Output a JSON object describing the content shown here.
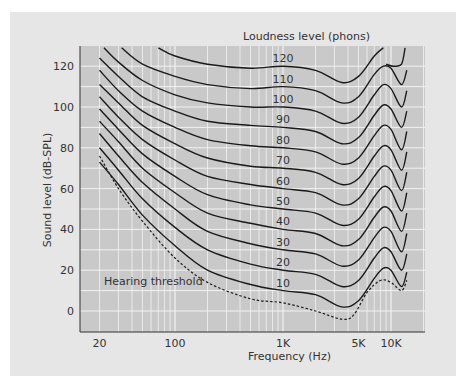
{
  "chart_data": {
    "type": "line",
    "title": "Loudness level (phons)",
    "xlabel": "Frequency (Hz)",
    "ylabel": "Sound level (dB-SPL)",
    "x_scale": "log",
    "xlim": [
      16,
      17000
    ],
    "ylim": [
      -9,
      130
    ],
    "grid": true,
    "x_ticks": [
      {
        "value": 20,
        "label": "20"
      },
      {
        "value": 100,
        "label": "100"
      },
      {
        "value": 1000,
        "label": "1K"
      },
      {
        "value": 5000,
        "label": "5K"
      },
      {
        "value": 10000,
        "label": "10K"
      }
    ],
    "y_ticks": [
      0,
      20,
      40,
      60,
      80,
      100,
      120
    ],
    "annotation": "Hearing threshold",
    "series": [
      {
        "name": "Hearing threshold",
        "style": "dashed",
        "points": [
          [
            20,
            76
          ],
          [
            30,
            60
          ],
          [
            50,
            44
          ],
          [
            100,
            26
          ],
          [
            200,
            14
          ],
          [
            500,
            6
          ],
          [
            1000,
            4
          ],
          [
            2000,
            0
          ],
          [
            3500,
            -4
          ],
          [
            4500,
            -2
          ],
          [
            6000,
            9
          ],
          [
            8000,
            15
          ],
          [
            10000,
            14
          ],
          [
            12500,
            10
          ],
          [
            14000,
            15
          ]
        ]
      },
      {
        "name": "10",
        "points": [
          [
            20,
            73
          ],
          [
            30,
            62
          ],
          [
            50,
            47
          ],
          [
            100,
            32
          ],
          [
            200,
            20
          ],
          [
            500,
            13
          ],
          [
            1000,
            10
          ],
          [
            2000,
            8
          ],
          [
            3500,
            2
          ],
          [
            5000,
            5
          ],
          [
            7000,
            16
          ],
          [
            8500,
            21
          ],
          [
            10000,
            20
          ],
          [
            12500,
            12
          ],
          [
            14000,
            19
          ]
        ]
      },
      {
        "name": "20",
        "points": [
          [
            20,
            80
          ],
          [
            30,
            69
          ],
          [
            50,
            55
          ],
          [
            100,
            41
          ],
          [
            200,
            30
          ],
          [
            500,
            23
          ],
          [
            1000,
            20
          ],
          [
            2000,
            18
          ],
          [
            3500,
            12
          ],
          [
            5000,
            15
          ],
          [
            7000,
            26
          ],
          [
            8500,
            31
          ],
          [
            10000,
            29
          ],
          [
            12500,
            20
          ],
          [
            14000,
            28
          ]
        ]
      },
      {
        "name": "30",
        "points": [
          [
            20,
            87
          ],
          [
            30,
            76
          ],
          [
            50,
            63
          ],
          [
            100,
            50
          ],
          [
            200,
            39
          ],
          [
            500,
            33
          ],
          [
            1000,
            30
          ],
          [
            2000,
            28
          ],
          [
            3500,
            22
          ],
          [
            5000,
            25
          ],
          [
            7000,
            36
          ],
          [
            8500,
            41
          ],
          [
            10000,
            39
          ],
          [
            12500,
            29
          ],
          [
            14000,
            38
          ]
        ]
      },
      {
        "name": "40",
        "points": [
          [
            20,
            93
          ],
          [
            30,
            83
          ],
          [
            50,
            70
          ],
          [
            100,
            58
          ],
          [
            200,
            48
          ],
          [
            500,
            43
          ],
          [
            1000,
            40
          ],
          [
            2000,
            38
          ],
          [
            3500,
            32
          ],
          [
            5000,
            35
          ],
          [
            7000,
            46
          ],
          [
            8500,
            51
          ],
          [
            10000,
            49
          ],
          [
            12500,
            39
          ],
          [
            14000,
            48
          ]
        ]
      },
      {
        "name": "50",
        "points": [
          [
            20,
            99
          ],
          [
            30,
            89
          ],
          [
            50,
            77
          ],
          [
            100,
            66
          ],
          [
            200,
            57
          ],
          [
            500,
            52
          ],
          [
            1000,
            50
          ],
          [
            2000,
            48
          ],
          [
            3500,
            42
          ],
          [
            5000,
            45
          ],
          [
            7000,
            56
          ],
          [
            8500,
            61
          ],
          [
            10000,
            59
          ],
          [
            12500,
            49
          ],
          [
            14000,
            58
          ]
        ]
      },
      {
        "name": "60",
        "points": [
          [
            20,
            105
          ],
          [
            30,
            95
          ],
          [
            50,
            84
          ],
          [
            100,
            74
          ],
          [
            200,
            66
          ],
          [
            500,
            62
          ],
          [
            1000,
            60
          ],
          [
            2000,
            58
          ],
          [
            3500,
            52
          ],
          [
            5000,
            55
          ],
          [
            7000,
            66
          ],
          [
            8500,
            71
          ],
          [
            10000,
            69
          ],
          [
            12500,
            59
          ],
          [
            14000,
            68
          ]
        ]
      },
      {
        "name": "70",
        "points": [
          [
            20,
            111
          ],
          [
            30,
            102
          ],
          [
            50,
            91
          ],
          [
            100,
            82
          ],
          [
            200,
            75
          ],
          [
            500,
            71
          ],
          [
            1000,
            70
          ],
          [
            2000,
            68
          ],
          [
            3500,
            62
          ],
          [
            5000,
            65
          ],
          [
            7000,
            76
          ],
          [
            8500,
            81
          ],
          [
            10000,
            79
          ],
          [
            12500,
            69
          ],
          [
            14000,
            78
          ]
        ]
      },
      {
        "name": "80",
        "points": [
          [
            20,
            118
          ],
          [
            30,
            108
          ],
          [
            50,
            98
          ],
          [
            100,
            90
          ],
          [
            200,
            84
          ],
          [
            500,
            81
          ],
          [
            1000,
            80
          ],
          [
            2000,
            78
          ],
          [
            3500,
            72
          ],
          [
            5000,
            75
          ],
          [
            7000,
            86
          ],
          [
            8500,
            91
          ],
          [
            10000,
            89
          ],
          [
            12500,
            79
          ],
          [
            14000,
            88
          ]
        ]
      },
      {
        "name": "90",
        "points": [
          [
            20,
            124
          ],
          [
            30,
            115
          ],
          [
            50,
            105
          ],
          [
            100,
            98
          ],
          [
            200,
            93
          ],
          [
            500,
            91
          ],
          [
            1000,
            90
          ],
          [
            2000,
            88
          ],
          [
            3500,
            82
          ],
          [
            5000,
            85
          ],
          [
            7000,
            96
          ],
          [
            8500,
            101
          ],
          [
            10000,
            99
          ],
          [
            12500,
            90
          ],
          [
            14000,
            98
          ]
        ]
      },
      {
        "name": "100",
        "points": [
          [
            22,
            129
          ],
          [
            30,
            122
          ],
          [
            50,
            113
          ],
          [
            100,
            106
          ],
          [
            200,
            102
          ],
          [
            500,
            100
          ],
          [
            1000,
            100
          ],
          [
            2000,
            98
          ],
          [
            3500,
            92
          ],
          [
            5000,
            95
          ],
          [
            7000,
            106
          ],
          [
            8500,
            111
          ],
          [
            10000,
            109
          ],
          [
            12500,
            100
          ],
          [
            14000,
            108
          ]
        ]
      },
      {
        "name": "110",
        "points": [
          [
            32,
            129
          ],
          [
            50,
            121
          ],
          [
            100,
            115
          ],
          [
            200,
            111
          ],
          [
            500,
            109
          ],
          [
            1000,
            110
          ],
          [
            2000,
            108
          ],
          [
            3500,
            102
          ],
          [
            5000,
            105
          ],
          [
            7000,
            116
          ],
          [
            8500,
            120
          ],
          [
            10000,
            119
          ],
          [
            12500,
            111
          ],
          [
            14000,
            118
          ]
        ]
      },
      {
        "name": "120",
        "points": [
          [
            70,
            129
          ],
          [
            100,
            125
          ],
          [
            200,
            121
          ],
          [
            500,
            119
          ],
          [
            1000,
            120
          ],
          [
            2000,
            118
          ],
          [
            3500,
            112
          ],
          [
            5000,
            115
          ],
          [
            7000,
            125
          ],
          [
            8500,
            129
          ]
        ]
      }
    ],
    "extra_segments": [
      {
        "name": "120-tail",
        "points": [
          [
            9000,
            121
          ],
          [
            10500,
            120
          ],
          [
            12500,
            121
          ],
          [
            13500,
            129
          ]
        ]
      }
    ]
  },
  "labels": {
    "title": "Loudness level (phons)",
    "xlabel": "Frequency (Hz)",
    "ylabel": "Sound level (dB-SPL)",
    "threshold": "Hearing threshold",
    "phons": [
      "120",
      "110",
      "100",
      "90",
      "80",
      "70",
      "60",
      "50",
      "40",
      "30",
      "20",
      "10"
    ]
  },
  "colors": {
    "panel_bg": "#e6e6e6",
    "plot_bg": "#c9c9c9",
    "grid": "#f2f2f2",
    "curve": "#1a1a1a",
    "text": "#333333"
  }
}
